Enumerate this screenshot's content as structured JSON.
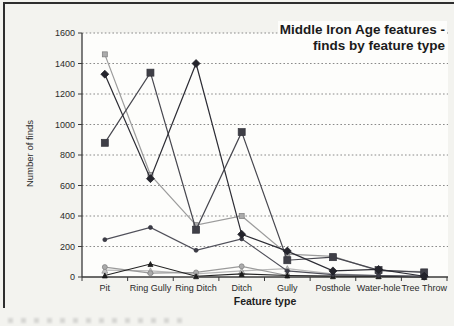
{
  "figure": {
    "title_line1": "Middle Iron Age features -",
    "title_line2": "finds by feature type",
    "y_axis_title": "Number of finds",
    "x_axis_title": "Feature type"
  },
  "chart_data": {
    "type": "line",
    "title": "Middle Iron Age features - finds by feature type",
    "xlabel": "Feature type",
    "ylabel": "Number of finds",
    "ylim": [
      0,
      1600
    ],
    "yticks": [
      0,
      200,
      400,
      600,
      800,
      1000,
      1200,
      1400,
      1600
    ],
    "grid": "horizontal-dotted",
    "legend": "none",
    "categories": [
      "Pit",
      "Ring Gully",
      "Ring Ditch",
      "Ditch",
      "Gully",
      "Posthole",
      "Water-hole",
      "Tree Throw"
    ],
    "series": [
      {
        "name": "light-gray-square-series",
        "marker": "square",
        "marker_size": 5,
        "color": "#9c9c9c",
        "fill": "#ababab",
        "edge": "#7a7a7a",
        "values": [
          1460,
          670,
          340,
          400,
          150,
          135,
          40,
          35
        ]
      },
      {
        "name": "pale-triangle-series",
        "marker": "triangle",
        "marker_size": 6,
        "color": "#b9b9b9",
        "fill": "#c4c4c4",
        "edge": "#8f8f8f",
        "values": [
          45,
          40,
          20,
          40,
          55,
          20,
          10,
          5
        ]
      },
      {
        "name": "gray-circle-series",
        "marker": "circle",
        "marker_size": 5,
        "color": "#9a9a9a",
        "fill": "#ababab",
        "edge": "#7e7e7e",
        "values": [
          65,
          25,
          30,
          70,
          10,
          10,
          10,
          5
        ]
      },
      {
        "name": "black-triangle-series",
        "marker": "triangle",
        "marker_size": 5,
        "color": "#222222",
        "fill": "#1e1e1e",
        "edge": "#111111",
        "values": [
          10,
          85,
          5,
          20,
          10,
          5,
          5,
          0
        ]
      },
      {
        "name": "small-dot-series",
        "marker": "circle",
        "marker_size": 4,
        "color": "#50505a",
        "fill": "#3c3c46",
        "edge": "#32323c",
        "values": [
          245,
          325,
          175,
          250,
          40,
          15,
          10,
          5
        ]
      },
      {
        "name": "dark-square-series",
        "marker": "square",
        "marker_size": 7,
        "color": "#47474f",
        "fill": "#3f3f47",
        "edge": "#33333b",
        "values": [
          880,
          1340,
          310,
          950,
          110,
          130,
          45,
          30
        ]
      },
      {
        "name": "dark-diamond-series",
        "marker": "diamond",
        "marker_size": 8,
        "color": "#2c2c34",
        "fill": "#24242c",
        "edge": "#1b1b23",
        "values": [
          1330,
          645,
          1400,
          280,
          170,
          40,
          50,
          5
        ]
      }
    ]
  },
  "ui": {
    "background": "#f3f3ef",
    "plot_background": "#fdfdfb",
    "axis_color": "#3a3a3a",
    "grid_color": "#7d7d7d",
    "text_color": "#2a2a2a"
  }
}
